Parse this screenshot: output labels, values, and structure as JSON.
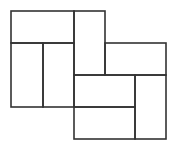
{
  "diagram": {
    "type": "tiling-of-rectangles",
    "stroke_color": "#333333",
    "background": "#ffffff",
    "stroke_width": 1.6,
    "rects": [
      {
        "name": "top-left-wide",
        "x": 11,
        "y": 11,
        "w": 63,
        "h": 32
      },
      {
        "name": "left-tall-a",
        "x": 11,
        "y": 43,
        "w": 32,
        "h": 64
      },
      {
        "name": "left-tall-b",
        "x": 43,
        "y": 43,
        "w": 31,
        "h": 64
      },
      {
        "name": "center-tall",
        "x": 74,
        "y": 11,
        "w": 31,
        "h": 64
      },
      {
        "name": "right-top-wide",
        "x": 105,
        "y": 43,
        "w": 61,
        "h": 32
      },
      {
        "name": "lower-wide-a",
        "x": 74,
        "y": 75,
        "w": 61,
        "h": 32
      },
      {
        "name": "lower-wide-b",
        "x": 74,
        "y": 107,
        "w": 61,
        "h": 32
      },
      {
        "name": "right-tall",
        "x": 135,
        "y": 75,
        "w": 31,
        "h": 64
      }
    ]
  }
}
